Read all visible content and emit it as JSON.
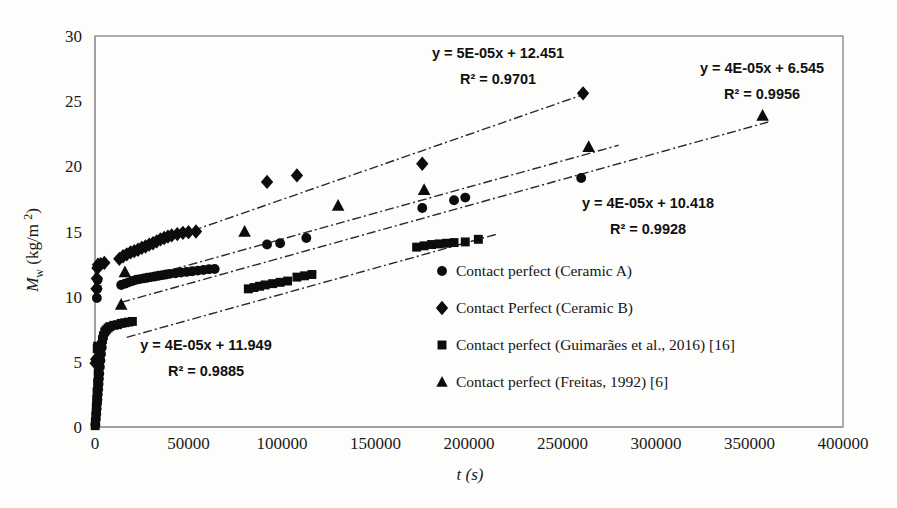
{
  "chart_data": {
    "type": "scatter",
    "title": "",
    "xlabel": "t (s)",
    "ylabel": "M_w (kg/m 2)",
    "ylabel_parts": {
      "symbol": "M",
      "subscript": "w",
      "units": "(kg/m",
      "sup": "2",
      "close": ")"
    },
    "xlim": [
      0,
      400000
    ],
    "ylim": [
      0,
      30
    ],
    "x_ticks": [
      "0",
      "50000",
      "100000",
      "150000",
      "200000",
      "250000",
      "300000",
      "350000",
      "400000"
    ],
    "x_tick_values": [
      0,
      50000,
      100000,
      150000,
      200000,
      250000,
      300000,
      350000,
      400000
    ],
    "y_ticks": [
      "0",
      "5",
      "10",
      "15",
      "20",
      "25",
      "30"
    ],
    "y_tick_values": [
      0,
      5,
      10,
      15,
      20,
      25,
      30
    ],
    "grid": false,
    "legend_position": "inside-lower-right",
    "series": [
      {
        "name": "Contact perfect (Ceramic A)",
        "marker": "circle",
        "equation": "y = 4E-05x + 10.418",
        "r2": "R² = 0.9928",
        "fit_slope": 4e-05,
        "fit_intercept": 10.418,
        "fit_x_range": [
          15000,
          280000
        ],
        "points": [
          [
            200,
            0.2
          ],
          [
            400,
            0.6
          ],
          [
            700,
            1.0
          ],
          [
            900,
            1.4
          ],
          [
            1100,
            1.8
          ],
          [
            1300,
            2.1
          ],
          [
            1500,
            2.5
          ],
          [
            1700,
            2.9
          ],
          [
            1900,
            3.3
          ],
          [
            2100,
            3.7
          ],
          [
            2300,
            4.1
          ],
          [
            2600,
            4.6
          ],
          [
            2900,
            5.1
          ],
          [
            3200,
            5.6
          ],
          [
            3600,
            6.1
          ],
          [
            1000,
            9.9
          ],
          [
            1200,
            10.6
          ],
          [
            1400,
            11.3
          ],
          [
            14000,
            10.9
          ],
          [
            16000,
            11.0
          ],
          [
            18000,
            11.1
          ],
          [
            20000,
            11.2
          ],
          [
            22000,
            11.3
          ],
          [
            24000,
            11.35
          ],
          [
            26000,
            11.4
          ],
          [
            28000,
            11.45
          ],
          [
            30000,
            11.5
          ],
          [
            32000,
            11.55
          ],
          [
            34000,
            11.6
          ],
          [
            36000,
            11.65
          ],
          [
            38000,
            11.7
          ],
          [
            40000,
            11.75
          ],
          [
            43000,
            11.8
          ],
          [
            46000,
            11.85
          ],
          [
            49000,
            11.9
          ],
          [
            52000,
            11.95
          ],
          [
            55000,
            12.0
          ],
          [
            58000,
            12.05
          ],
          [
            61000,
            12.1
          ],
          [
            64000,
            12.12
          ],
          [
            92000,
            14.0
          ],
          [
            99000,
            14.1
          ],
          [
            113000,
            14.5
          ],
          [
            175000,
            16.8
          ],
          [
            192000,
            17.4
          ],
          [
            198000,
            17.6
          ],
          [
            260000,
            19.1
          ]
        ]
      },
      {
        "name": "Contact Perfect (Ceramic B)",
        "marker": "diamond",
        "equation": "y = 5E-05x + 12.451",
        "r2": "R² = 0.9701",
        "fit_slope": 5e-05,
        "fit_intercept": 12.451,
        "fit_x_range": [
          18000,
          262000
        ],
        "points": [
          [
            300,
            4.9
          ],
          [
            600,
            5.2
          ],
          [
            800,
            10.6
          ],
          [
            1000,
            11.4
          ],
          [
            1300,
            12.2
          ],
          [
            1600,
            12.45
          ],
          [
            3000,
            12.5
          ],
          [
            5000,
            12.6
          ],
          [
            13000,
            12.9
          ],
          [
            15000,
            13.1
          ],
          [
            17000,
            13.25
          ],
          [
            19000,
            13.4
          ],
          [
            21000,
            13.5
          ],
          [
            23000,
            13.6
          ],
          [
            25000,
            13.75
          ],
          [
            27000,
            13.85
          ],
          [
            29000,
            14.0
          ],
          [
            31000,
            14.1
          ],
          [
            33000,
            14.25
          ],
          [
            35000,
            14.4
          ],
          [
            37000,
            14.5
          ],
          [
            39000,
            14.6
          ],
          [
            41000,
            14.7
          ],
          [
            44000,
            14.8
          ],
          [
            47000,
            14.9
          ],
          [
            50000,
            14.95
          ],
          [
            54000,
            15.0
          ],
          [
            92000,
            18.8
          ],
          [
            108000,
            19.3
          ],
          [
            175000,
            20.2
          ],
          [
            261000,
            25.6
          ]
        ]
      },
      {
        "name": "Contact perfect (Guimarães et al., 2016) [16]",
        "marker": "square",
        "equation": "y = 4E-05x + 11.949",
        "r2": "R² = 0.9885",
        "fit_slope": 4e-05,
        "fit_intercept": 6.2,
        "fit_x_range": [
          17000,
          215000
        ],
        "points": [
          [
            100,
            0.1
          ],
          [
            300,
            0.4
          ],
          [
            500,
            0.9
          ],
          [
            700,
            1.5
          ],
          [
            900,
            2.1
          ],
          [
            1100,
            2.7
          ],
          [
            1400,
            3.4
          ],
          [
            1700,
            4.1
          ],
          [
            2000,
            4.7
          ],
          [
            1200,
            6.0
          ],
          [
            1400,
            6.2
          ],
          [
            3000,
            5.8
          ],
          [
            3500,
            6.3
          ],
          [
            4000,
            6.7
          ],
          [
            4500,
            7.0
          ],
          [
            5200,
            7.3
          ],
          [
            6000,
            7.45
          ],
          [
            7000,
            7.6
          ],
          [
            8000,
            7.7
          ],
          [
            10000,
            7.8
          ],
          [
            12000,
            7.85
          ],
          [
            14000,
            7.95
          ],
          [
            16000,
            8.0
          ],
          [
            18000,
            8.05
          ],
          [
            20000,
            8.1
          ],
          [
            82000,
            10.6
          ],
          [
            85000,
            10.7
          ],
          [
            88000,
            10.8
          ],
          [
            91000,
            10.9
          ],
          [
            95000,
            11.0
          ],
          [
            99000,
            11.1
          ],
          [
            103000,
            11.2
          ],
          [
            108000,
            11.5
          ],
          [
            112000,
            11.6
          ],
          [
            116000,
            11.7
          ],
          [
            172000,
            13.8
          ],
          [
            176000,
            13.9
          ],
          [
            180000,
            14.0
          ],
          [
            184000,
            14.05
          ],
          [
            188000,
            14.1
          ],
          [
            192000,
            14.15
          ],
          [
            198000,
            14.2
          ],
          [
            205000,
            14.4
          ]
        ]
      },
      {
        "name": "Contact perfect (Freitas, 1992) [6]",
        "marker": "triangle",
        "equation": "y = 4E-05x + 6.545",
        "r2": "R² = 0.9956",
        "fit_slope": 4e-05,
        "fit_intercept": 9.0,
        "fit_x_range": [
          14000,
          360000
        ],
        "points": [
          [
            14000,
            9.4
          ],
          [
            16000,
            11.9
          ],
          [
            80000,
            15.0
          ],
          [
            130000,
            17.0
          ],
          [
            176000,
            18.2
          ],
          [
            264000,
            21.5
          ],
          [
            357000,
            23.9
          ]
        ]
      }
    ],
    "annotations": [
      {
        "id": "eq-ceramic-b",
        "line1": "y = 5E-05x + 12.451",
        "line2": "R² = 0.9701",
        "x": 498,
        "y": 58
      },
      {
        "id": "eq-freitas",
        "line1": "y = 4E-05x + 6.545",
        "line2": "R² = 0.9956",
        "x": 762,
        "y": 73
      },
      {
        "id": "eq-ceramic-a",
        "line1": "y = 4E-05x + 10.418",
        "line2": "R² = 0.9928",
        "x": 648,
        "y": 208
      },
      {
        "id": "eq-guimaraes",
        "line1": "y = 4E-05x + 11.949",
        "line2": "R² = 0.9885",
        "x": 206,
        "y": 350
      }
    ],
    "legend_entries": [
      {
        "marker": "circle",
        "label": "Contact perfect (Ceramic A)"
      },
      {
        "marker": "diamond",
        "label": "Contact Perfect (Ceramic B)"
      },
      {
        "marker": "square",
        "label": "Contact perfect (Guimarães et al., 2016) [16]"
      },
      {
        "marker": "triangle",
        "label": "Contact perfect (Freitas, 1992) [6]"
      }
    ],
    "colors": {
      "marker": "#0c0c0c",
      "trendline": "#2a2a2a",
      "frame": "#8c8c8c",
      "text": "#1a1a1a",
      "background": "#fdfdfc"
    }
  }
}
